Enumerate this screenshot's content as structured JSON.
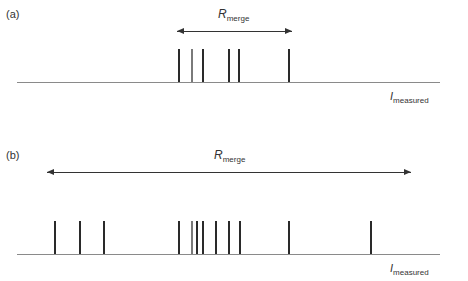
{
  "panels": [
    {
      "label": "(a)",
      "range_symbol": "R",
      "range_subscript": "merge",
      "axis_symbol": "I",
      "axis_subscript": "measured",
      "arrow": {
        "x1": 177,
        "x2": 292,
        "y": 31
      },
      "axis": {
        "x1": 17,
        "x2": 440,
        "y": 82
      },
      "bar_top": 49,
      "bars": [
        {
          "x": 179,
          "shade": "dark"
        },
        {
          "x": 192,
          "shade": "gray"
        },
        {
          "x": 203,
          "shade": "dark"
        },
        {
          "x": 229,
          "shade": "dark"
        },
        {
          "x": 239,
          "shade": "dark"
        },
        {
          "x": 289,
          "shade": "dark"
        }
      ]
    },
    {
      "label": "(b)",
      "range_symbol": "R",
      "range_subscript": "merge",
      "axis_symbol": "I",
      "axis_subscript": "measured",
      "arrow": {
        "x1": 47,
        "x2": 411,
        "y": 172
      },
      "axis": {
        "x1": 17,
        "x2": 440,
        "y": 254
      },
      "bar_top": 221,
      "bars": [
        {
          "x": 55,
          "shade": "dark"
        },
        {
          "x": 80,
          "shade": "dark"
        },
        {
          "x": 104,
          "shade": "dark"
        },
        {
          "x": 179,
          "shade": "dark"
        },
        {
          "x": 192,
          "shade": "gray"
        },
        {
          "x": 197,
          "shade": "dark"
        },
        {
          "x": 203,
          "shade": "dark"
        },
        {
          "x": 216,
          "shade": "dark"
        },
        {
          "x": 229,
          "shade": "dark"
        },
        {
          "x": 240,
          "shade": "dark"
        },
        {
          "x": 289,
          "shade": "dark"
        },
        {
          "x": 371,
          "shade": "dark"
        }
      ]
    }
  ],
  "colors": {
    "bar_dark": "#2a2a2a",
    "bar_gray": "#7a7a7a",
    "axis": "#8a8a8a",
    "arrow": "#333333"
  }
}
